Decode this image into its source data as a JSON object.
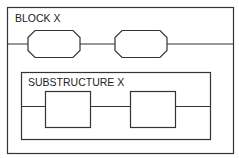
{
  "diagram": {
    "outer_block": {
      "label": "BLOCK X"
    },
    "top_row": {
      "elements": [
        "octagon",
        "octagon"
      ]
    },
    "substructure": {
      "label": "SUBSTRUCTURE X",
      "elements": [
        "square",
        "square"
      ]
    },
    "colors": {
      "stroke": "#333333",
      "background": "#ffffff"
    }
  }
}
